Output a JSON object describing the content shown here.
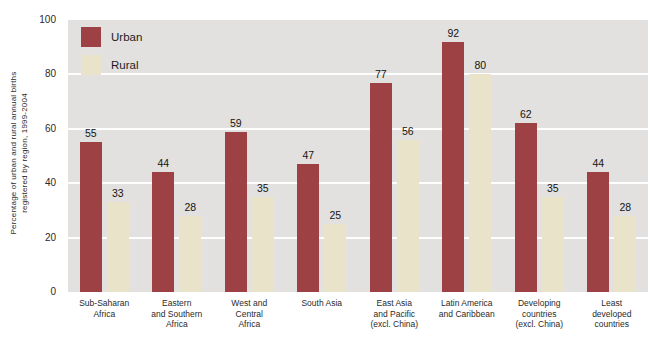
{
  "chart_data": {
    "type": "bar",
    "title": "",
    "ylabel_line1": "Percentage of urban and rural annual births",
    "ylabel_line2": "registered by region, 1999-2004",
    "ylim": [
      0,
      100
    ],
    "yticks": [
      0,
      20,
      40,
      60,
      80,
      100
    ],
    "grid": "horizontal white gridlines every 20 units",
    "legend_position": "top-left inside plot",
    "plot_background": "#e2e1df",
    "gridline_color": "#ffffff",
    "text_color": "#1c1c1c",
    "categories": [
      "Sub-Saharan\nAfrica",
      "Eastern\nand Southern\nAfrica",
      "West and\nCentral\nAfrica",
      "South Asia",
      "East Asia\nand Pacific\n(excl. China)",
      "Latin America\nand Caribbean",
      "Developing\ncountries\n(excl. China)",
      "Least\ndeveloped\ncountries"
    ],
    "series": [
      {
        "name": "Urban",
        "color": "#9d4144",
        "values": [
          55,
          44,
          59,
          47,
          77,
          92,
          62,
          44
        ]
      },
      {
        "name": "Rural",
        "color": "#e8e3c9",
        "values": [
          33,
          28,
          35,
          25,
          56,
          80,
          35,
          28
        ]
      }
    ]
  }
}
